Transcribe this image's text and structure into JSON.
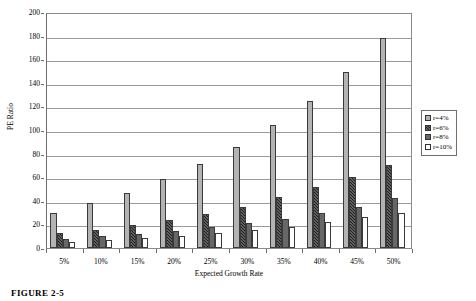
{
  "figure": {
    "caption": "FIGURE 2-5"
  },
  "legend": {
    "position": "right",
    "items": [
      {
        "label": "r=4%",
        "swatch": "light-gray-swatch",
        "series_index": 0
      },
      {
        "label": "r=6%",
        "swatch": "black-hatched-swatch",
        "series_index": 1
      },
      {
        "label": "r=8%",
        "swatch": "dark-gray-swatch",
        "series_index": 2
      },
      {
        "label": "r=10%",
        "swatch": "white-swatch",
        "series_index": 3
      }
    ]
  },
  "chart_data": {
    "type": "bar",
    "title": "",
    "xlabel": "Expected Growth Rate",
    "ylabel": "PE Ratio",
    "categories": [
      "5%",
      "10%",
      "15%",
      "20%",
      "25%",
      "30%",
      "35%",
      "40%",
      "45%",
      "50%"
    ],
    "ylim": [
      0,
      200
    ],
    "yticks": [
      0,
      20,
      40,
      60,
      80,
      100,
      120,
      140,
      160,
      180,
      200
    ],
    "grid": true,
    "series": [
      {
        "name": "r=4%",
        "color": "#b3b3b3",
        "values": [
          30,
          38,
          47,
          58.5,
          71,
          86,
          104,
          125,
          149,
          178
        ]
      },
      {
        "name": "r=6%",
        "color": "#1c1c1c",
        "values": [
          12.5,
          15.5,
          19.5,
          24,
          29,
          35,
          43,
          51.5,
          60,
          70
        ]
      },
      {
        "name": "r=8%",
        "color": "#676767",
        "values": [
          8,
          10,
          12,
          14.5,
          17.5,
          21,
          25,
          29.5,
          35,
          42
        ]
      },
      {
        "name": "r=10%",
        "color": "#ffffff",
        "values": [
          5.5,
          7,
          8.5,
          10.5,
          12.5,
          15,
          18,
          22,
          26,
          30
        ]
      }
    ]
  }
}
